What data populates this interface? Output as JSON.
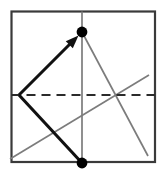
{
  "figure": {
    "title": "",
    "kind": "origami-fold-diagram",
    "canvas": {
      "width": 163,
      "height": 175,
      "background": "#ffffff"
    },
    "colors": {
      "square_border": "#3a3a3a",
      "fold_line_dashed": "#2b2b2b",
      "crease_gray": "#7c7c7c",
      "arrow_black": "#111111",
      "dot_black": "#000000"
    },
    "square": {
      "name": "paper-square",
      "x": 11.5,
      "y": 11.5,
      "width": 143.5,
      "height": 150.5,
      "stroke_width": 2.2
    },
    "dashed_fold": {
      "name": "horizontal-fold-line",
      "x1": 11.5,
      "y1": 95,
      "x2": 155,
      "y2": 95,
      "stroke_width": 1.9,
      "dash": "9 6"
    },
    "vertical_crease": {
      "name": "vertical-crease-line",
      "x1": 82,
      "y1": 11.5,
      "x2": 82,
      "y2": 163,
      "stroke_width": 1.7
    },
    "crease_descending": {
      "name": "crease-from-top-dot-descending",
      "x1": 82,
      "y1": 32,
      "x2": 148,
      "y2": 156,
      "stroke_width": 1.7
    },
    "crease_ascending": {
      "name": "crease-ascending-to-right",
      "x1": 10,
      "y1": 159,
      "x2": 149,
      "y2": 75,
      "stroke_width": 1.7
    },
    "arrow_fold": {
      "name": "fold-arrow",
      "x1": 19,
      "y1": 95,
      "x2": 78.5,
      "y2": 35.5,
      "stroke_width": 3.1,
      "head_length": 13,
      "head_width": 10
    },
    "flap_edge": {
      "name": "flap-lower-edge",
      "x1": 19,
      "y1": 95,
      "x2": 82,
      "y2": 163,
      "stroke_width": 3.1
    },
    "points": [
      {
        "name": "reference-point-top",
        "cx": 82,
        "cy": 32,
        "r": 5.4
      },
      {
        "name": "reference-point-bottom",
        "cx": 82,
        "cy": 163,
        "r": 5.4
      }
    ]
  }
}
